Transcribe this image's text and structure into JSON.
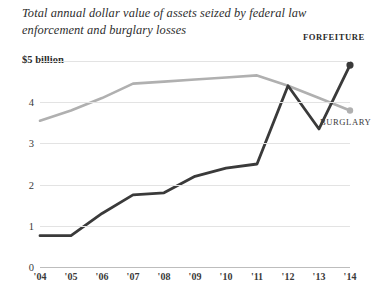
{
  "title": "Total annual dollar value of assets seized by federal law enforcement and burglary losses",
  "axis": {
    "y_top_label": "$5 billion",
    "y_ticks": [
      "4",
      "3",
      "2",
      "1",
      "0"
    ],
    "x_ticks": [
      "'04",
      "'05",
      "'06",
      "'07",
      "'08",
      "'09",
      "'10",
      "'11",
      "'12",
      "'13",
      "'14"
    ]
  },
  "labels": {
    "forfeiture": "FORFEITURE",
    "burglary": "BURGLARY"
  },
  "colors": {
    "forfeiture": "#3a3a3a",
    "burglary": "#b0b0b0",
    "grid": "#e3e3e3",
    "axis": "#bdbdbd",
    "text": "#3a3a3a"
  },
  "chart_data": {
    "type": "line",
    "title": "Total annual dollar value of assets seized by federal law enforcement and burglary losses",
    "xlabel": "",
    "ylabel": "$5 billion",
    "x": [
      "'04",
      "'05",
      "'06",
      "'07",
      "'08",
      "'09",
      "'10",
      "'11",
      "'12",
      "'13",
      "'14"
    ],
    "ylim": [
      0,
      5
    ],
    "yticks": [
      0,
      1,
      2,
      3,
      4,
      5
    ],
    "grid": true,
    "legend": "inline-end-of-line",
    "series": [
      {
        "name": "FORFEITURE",
        "color": "#3a3a3a",
        "values": [
          0.76,
          0.76,
          1.3,
          1.75,
          1.8,
          2.2,
          2.4,
          2.5,
          4.4,
          3.35,
          4.9
        ]
      },
      {
        "name": "BURGLARY",
        "color": "#b0b0b0",
        "values": [
          3.55,
          3.8,
          4.1,
          4.45,
          4.5,
          4.55,
          4.6,
          4.65,
          4.4,
          4.1,
          3.8
        ]
      }
    ]
  }
}
